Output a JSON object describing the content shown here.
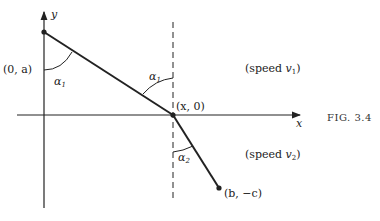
{
  "figure": {
    "caption": "Fig. 3.4",
    "caption_display": "FIG. 3.4",
    "colors": {
      "ink": "#222222",
      "background": "#ffffff"
    }
  },
  "axes": {
    "x_label": "x",
    "y_label": "y"
  },
  "points": {
    "start": "(0, a)",
    "interface": "(x, 0)",
    "end": "(b, −c)"
  },
  "angles": {
    "alpha1_top": "α",
    "alpha1_top_sub": "1",
    "alpha1_right": "α",
    "alpha1_right_sub": "1",
    "alpha2": "α",
    "alpha2_sub": "2"
  },
  "regions": {
    "upper": {
      "prefix": "(speed ",
      "var": "v",
      "sub": "1",
      "suffix": ")"
    },
    "lower": {
      "prefix": "(speed ",
      "var": "v",
      "sub": "2",
      "suffix": ")"
    }
  }
}
